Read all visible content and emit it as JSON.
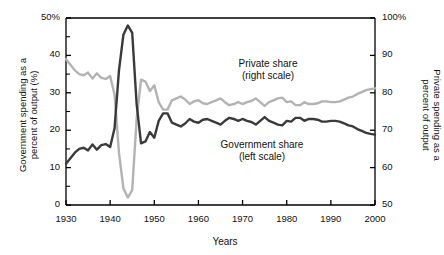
{
  "axes": {
    "left_title": "Government spending as a\npercent of output (%)",
    "right_title": "Private spending as a\npercent of output",
    "x_title": "Years",
    "y_left_ticks": [
      "50%",
      "40",
      "30",
      "20",
      "10",
      "0"
    ],
    "y_right_ticks": [
      "100%",
      "90",
      "80",
      "70",
      "60",
      "50"
    ],
    "x_ticks": [
      "1930",
      "1940",
      "1950",
      "1960",
      "1970",
      "1980",
      "1990",
      "2000"
    ]
  },
  "labels": {
    "private": "Private share\n(right scale)",
    "government": "Government share\n(left scale)"
  },
  "colors": {
    "government_line": "#3a3a3a",
    "private_line": "#b3b3b3",
    "axis": "#000000",
    "background": "#ffffff"
  },
  "chart_data": {
    "type": "line",
    "title": "",
    "xlabel": "Years",
    "ylabel": "Government spending as a percent of output (%)",
    "y2label": "Private spending as a percent of output",
    "xlim": [
      1930,
      2000
    ],
    "ylim": [
      0,
      50
    ],
    "y2lim": [
      50,
      100
    ],
    "grid": false,
    "legend": "inline annotations",
    "x": [
      1930,
      1931,
      1932,
      1933,
      1934,
      1935,
      1936,
      1937,
      1938,
      1939,
      1940,
      1941,
      1942,
      1943,
      1944,
      1945,
      1946,
      1947,
      1948,
      1949,
      1950,
      1951,
      1952,
      1953,
      1954,
      1955,
      1956,
      1957,
      1958,
      1959,
      1960,
      1961,
      1962,
      1963,
      1964,
      1965,
      1966,
      1967,
      1968,
      1969,
      1970,
      1971,
      1972,
      1973,
      1974,
      1975,
      1976,
      1977,
      1978,
      1979,
      1980,
      1981,
      1982,
      1983,
      1984,
      1985,
      1986,
      1987,
      1988,
      1989,
      1990,
      1991,
      1992,
      1993,
      1994,
      1995,
      1996,
      1997,
      1998,
      1999,
      2000
    ],
    "series": [
      {
        "name": "Government share (left scale)",
        "axis": "left",
        "units": "percent of output",
        "color": "#3a3a3a",
        "values": [
          11.0,
          12.5,
          14.0,
          15.0,
          15.3,
          14.6,
          16.2,
          14.8,
          16.0,
          16.3,
          15.5,
          20.5,
          36.0,
          45.5,
          48.0,
          46.0,
          27.0,
          16.5,
          17.0,
          19.5,
          18.0,
          22.5,
          24.5,
          24.5,
          22.0,
          21.5,
          21.0,
          21.8,
          23.0,
          22.3,
          22.0,
          22.8,
          23.0,
          22.5,
          22.0,
          21.5,
          22.5,
          23.3,
          23.0,
          22.5,
          23.0,
          22.5,
          22.2,
          21.5,
          22.5,
          23.5,
          22.5,
          22.0,
          21.5,
          21.3,
          22.5,
          22.3,
          23.3,
          23.3,
          22.5,
          23.0,
          23.0,
          22.8,
          22.3,
          22.3,
          22.5,
          22.5,
          22.3,
          21.8,
          21.3,
          21.0,
          20.3,
          19.8,
          19.3,
          19.0,
          18.8
        ]
      },
      {
        "name": "Private share (right scale)",
        "axis": "right",
        "units": "percent of output",
        "color": "#b3b3b3",
        "values": [
          89.0,
          87.5,
          86.0,
          85.0,
          84.7,
          85.4,
          83.8,
          85.2,
          84.0,
          83.7,
          84.5,
          79.5,
          64.0,
          54.5,
          52.0,
          54.0,
          73.0,
          83.5,
          83.0,
          80.5,
          82.0,
          77.5,
          75.5,
          75.5,
          78.0,
          78.5,
          79.0,
          78.2,
          77.0,
          77.7,
          78.0,
          77.2,
          77.0,
          77.5,
          78.0,
          78.5,
          77.5,
          76.7,
          77.0,
          77.5,
          77.0,
          77.5,
          77.8,
          78.5,
          77.5,
          76.5,
          77.5,
          78.0,
          78.5,
          78.7,
          77.5,
          77.7,
          76.7,
          76.7,
          77.5,
          77.0,
          77.0,
          77.2,
          77.7,
          77.7,
          77.5,
          77.5,
          77.7,
          78.2,
          78.7,
          79.0,
          79.7,
          80.2,
          80.7,
          81.0,
          81.2
        ]
      }
    ]
  }
}
